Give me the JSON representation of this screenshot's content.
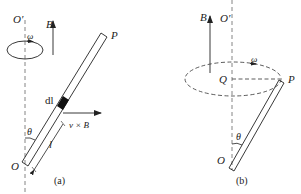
{
  "figure": {
    "panel_a": {
      "caption": "(a)",
      "labels": {
        "axis_top": "O′",
        "field": "B",
        "angular_velocity": "ω",
        "rod_end": "P",
        "element": "dl",
        "force_direction": "v × B",
        "length": "l",
        "angle": "θ",
        "pivot": "O"
      }
    },
    "panel_b": {
      "caption": "(b)",
      "labels": {
        "axis_top": "O′",
        "field": "B",
        "angular_velocity": "ω",
        "circle_center": "Q",
        "rod_end": "P",
        "angle": "θ",
        "pivot": "O"
      }
    },
    "colors": {
      "ink": "#222222",
      "dashed": "#555555",
      "background": "#ffffff"
    }
  }
}
